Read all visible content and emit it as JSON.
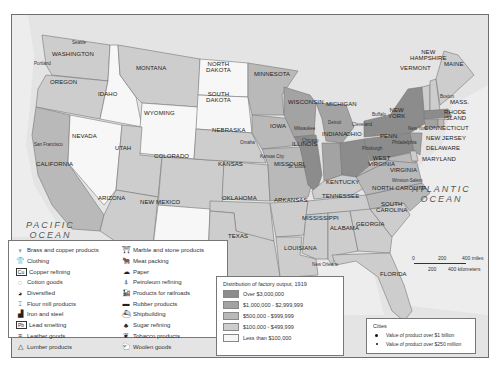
{
  "map": {
    "title": "Distribution of factory output, 1919",
    "oceans": [
      {
        "name": "PACIFIC\nOCEAN"
      },
      {
        "name": "ATLANTIC\nOCEAN"
      },
      {
        "name": "Gulf of Mexico"
      }
    ],
    "states": [
      {
        "name": "Washington",
        "tier": "$100,000 - $499,999",
        "industry": "Lumber products"
      },
      {
        "name": "Oregon",
        "tier": "$100,000 - $499,999",
        "industry": "Lumber products"
      },
      {
        "name": "California",
        "tier": "$500,000 - $999,999",
        "industry": "Diversified"
      },
      {
        "name": "Idaho",
        "tier": "Less than $100,000",
        "industry": "Lumber products"
      },
      {
        "name": "Nevada",
        "tier": "Less than $100,000",
        "industry": "Products for railroads"
      },
      {
        "name": "Montana",
        "tier": "$100,000 - $499,999",
        "industry": "Flour mill products"
      },
      {
        "name": "Wyoming",
        "tier": "Less than $100,000",
        "industry": "Products for railroads"
      },
      {
        "name": "Utah",
        "tier": "$100,000 - $499,999",
        "industry": "Lead smelting"
      },
      {
        "name": "Arizona",
        "tier": "$100,000 - $499,999",
        "industry": "Copper refining"
      },
      {
        "name": "Colorado",
        "tier": "$100,000 - $499,999",
        "industry": "Meat packing"
      },
      {
        "name": "New Mexico",
        "tier": "Less than $100,000",
        "industry": "Products for railroads"
      },
      {
        "name": "North Dakota",
        "tier": "Less than $100,000",
        "industry": "Flour mill products"
      },
      {
        "name": "South Dakota",
        "tier": "Less than $100,000",
        "industry": "Flour mill products"
      },
      {
        "name": "Nebraska",
        "tier": "$100,000 - $499,999",
        "industry": "Meat packing"
      },
      {
        "name": "Kansas",
        "tier": "$100,000 - $499,999",
        "industry": "Meat packing"
      },
      {
        "name": "Oklahoma",
        "tier": "$100,000 - $499,999",
        "industry": "Petroleum refining"
      },
      {
        "name": "Texas",
        "tier": "$100,000 - $499,999",
        "industry": "Petroleum refining"
      },
      {
        "name": "Minnesota",
        "tier": "$500,000 - $999,999",
        "industry": "Flour mill products"
      },
      {
        "name": "Iowa",
        "tier": "$500,000 - $999,999",
        "industry": "Meat packing"
      },
      {
        "name": "Missouri",
        "tier": "$500,000 - $999,999",
        "industry": "Meat packing"
      },
      {
        "name": "Arkansas",
        "tier": "$100,000 - $499,999",
        "industry": "Lumber products"
      },
      {
        "name": "Louisiana",
        "tier": "$100,000 - $499,999",
        "industry": "Sugar refining"
      },
      {
        "name": "Wisconsin",
        "tier": "$1,000,000 - $2,999,999",
        "industry": "Diversified"
      },
      {
        "name": "Illinois",
        "tier": "Over $3,000,000",
        "industry": "Meat packing"
      },
      {
        "name": "Michigan",
        "tier": "$1,000,000 - $2,999,999",
        "industry": "Diversified"
      },
      {
        "name": "Indiana",
        "tier": "$1,000,000 - $2,999,999",
        "industry": "Iron and steel"
      },
      {
        "name": "Ohio",
        "tier": "Over $3,000,000",
        "industry": "Iron and steel"
      },
      {
        "name": "Kentucky",
        "tier": "$100,000 - $499,999",
        "industry": "Flour mill products"
      },
      {
        "name": "Tennessee",
        "tier": "$100,000 - $499,999",
        "industry": "Flour mill products"
      },
      {
        "name": "Mississippi",
        "tier": "$100,000 - $499,999",
        "industry": "Lumber products"
      },
      {
        "name": "Alabama",
        "tier": "$100,000 - $499,999",
        "industry": "Cotton goods"
      },
      {
        "name": "Georgia",
        "tier": "$100,000 - $499,999",
        "industry": "Cotton goods"
      },
      {
        "name": "Florida",
        "tier": "$100,000 - $499,999",
        "industry": "Lumber products"
      },
      {
        "name": "South Carolina",
        "tier": "$100,000 - $499,999",
        "industry": "Cotton goods"
      },
      {
        "name": "North Carolina",
        "tier": "$500,000 - $999,999",
        "industry": "Cotton goods"
      },
      {
        "name": "Virginia",
        "tier": "$500,000 - $999,999",
        "industry": "Cotton goods"
      },
      {
        "name": "West Virginia",
        "tier": "$500,000 - $999,999",
        "industry": "Iron and steel"
      },
      {
        "name": "Pennsylvania",
        "tier": "Over $3,000,000",
        "industry": "Iron and steel"
      },
      {
        "name": "New York",
        "tier": "Over $3,000,000",
        "industry": "Clothing"
      },
      {
        "name": "New Jersey",
        "tier": "$1,000,000 - $2,999,999",
        "industry": "Diversified"
      },
      {
        "name": "Delaware",
        "tier": "$100,000 - $499,999",
        "industry": "Leather goods"
      },
      {
        "name": "Maryland",
        "tier": "$500,000 - $999,999",
        "industry": "Shipbuilding, Clothing"
      },
      {
        "name": "Connecticut",
        "tier": "$1,000,000 - $2,999,999",
        "industry": "Brass and copper products"
      },
      {
        "name": "Rhode Island",
        "tier": "$500,000 - $999,999",
        "industry": "Cotton goods, Woolen goods"
      },
      {
        "name": "Massachusetts",
        "tier": "Over $3,000,000",
        "industry": "Cotton goods"
      },
      {
        "name": "Vermont",
        "tier": "$100,000 - $499,999",
        "industry": "Marble and stone products"
      },
      {
        "name": "New Hampshire",
        "tier": "$100,000 - $499,999",
        "industry": "Cotton goods"
      },
      {
        "name": "Maine",
        "tier": "$100,000 - $499,999",
        "industry": "Paper"
      }
    ],
    "cities": [
      "Seattle",
      "Portland",
      "San Francisco",
      "Omaha",
      "Kansas City",
      "St. Louis",
      "Minneapolis",
      "Milwaukee",
      "Chicago",
      "Detroit",
      "Cleveland",
      "Cincinnati",
      "Toledo",
      "Buffalo",
      "Rochester",
      "Pittsburgh",
      "Philadelphia",
      "New York",
      "Boston",
      "Baltimore",
      "Louisville",
      "New Orleans",
      "Winston-Salem"
    ]
  },
  "state_labels": {
    "wa": "WASHINGTON",
    "or": "OREGON",
    "ca": "CALIFORNIA",
    "id": "IDAHO",
    "nv": "NEVADA",
    "mt": "MONTANA",
    "wy": "WYOMING",
    "ut": "UTAH",
    "az": "ARIZONA",
    "co": "COLORADO",
    "nm": "NEW MEXICO",
    "nd": "NORTH\nDAKOTA",
    "sd": "SOUTH\nDAKOTA",
    "ne": "NEBRASKA",
    "ks": "KANSAS",
    "ok": "OKLAHOMA",
    "tx": "TEXAS",
    "mn": "MINNESOTA",
    "ia": "IOWA",
    "mo": "MISSOURI",
    "ar": "ARKANSAS",
    "la": "LOUISIANA",
    "wi": "WISCONSIN",
    "il": "ILLINOIS",
    "mi": "MICHIGAN",
    "in": "INDIANA",
    "oh": "OHIO",
    "ky": "KENTUCKY",
    "tn": "TENNESSEE",
    "ms": "MISSISSIPPI",
    "al": "ALABAMA",
    "ga": "GEORGIA",
    "fl": "FLORIDA",
    "sc": "SOUTH\nCAROLINA",
    "nc": "NORTH CAROLINA",
    "va": "VIRGINIA",
    "wv": "WEST\nVIRGINIA",
    "pa": "PENN.",
    "ny": "NEW\nYORK",
    "nj": "NEW JERSEY",
    "de": "DELAWARE",
    "md": "MARYLAND",
    "ct": "CONNECTICUT",
    "ri": "RHODE\nISLAND",
    "ma": "MASS.",
    "vt": "VERMONT",
    "nh": "NEW\nHAMPSHIRE",
    "me": "MAINE"
  },
  "city_labels": {
    "seattle": "Seattle",
    "portland": "Portland",
    "sf": "San Francisco",
    "omaha": "Omaha",
    "kc": "Kansas City",
    "stl": "St. Louis",
    "minneapolis": "Minneapolis",
    "milwaukee": "Milwaukee",
    "chicago": "Chicago",
    "detroit": "Detroit",
    "cleveland": "Cleveland",
    "buffalo": "Buffalo",
    "pittsburgh": "Pittsburgh",
    "philadelphia": "Philadelphia",
    "nyc": "New York",
    "boston": "Boston",
    "neworleans": "New Orleans",
    "winston": "Winston-Salem",
    "gulf": "Gulf of Mexico"
  },
  "oceans": {
    "pacific": "PACIFIC\nOCEAN",
    "atlantic": "ATLANTIC\nOCEAN"
  },
  "industry_legend": {
    "col1": [
      {
        "icon": "brass-icon",
        "glyph": "♆",
        "label": "Brass and copper products"
      },
      {
        "icon": "clothing-icon",
        "glyph": "👕",
        "label": "Clothing"
      },
      {
        "icon": "copper-icon",
        "glyph": "Cu",
        "label": "Copper refining"
      },
      {
        "icon": "cotton-icon",
        "glyph": "◌",
        "label": "Cotton goods"
      },
      {
        "icon": "diversified-icon",
        "glyph": "◕",
        "label": "Diversified"
      },
      {
        "icon": "flour-icon",
        "glyph": "⌶",
        "label": "Flour mill products"
      },
      {
        "icon": "iron-steel-icon",
        "glyph": "▟",
        "label": "Iron and steel"
      },
      {
        "icon": "lead-icon",
        "glyph": "Pb",
        "label": "Lead smelting"
      },
      {
        "icon": "leather-icon",
        "glyph": "≡",
        "label": "Leather goods"
      },
      {
        "icon": "lumber-icon",
        "glyph": "△",
        "label": "Lumber products"
      }
    ],
    "col2": [
      {
        "icon": "marble-icon",
        "glyph": "⛩",
        "label": "Marble and stone products"
      },
      {
        "icon": "meat-icon",
        "glyph": "🐂",
        "label": "Meat packing"
      },
      {
        "icon": "paper-icon",
        "glyph": "☁",
        "label": "Paper"
      },
      {
        "icon": "petroleum-icon",
        "glyph": "⍋",
        "label": "Petroleum refining"
      },
      {
        "icon": "railroad-icon",
        "glyph": "🚂",
        "label": "Products for railroads"
      },
      {
        "icon": "rubber-icon",
        "glyph": "▬",
        "label": "Rubber products"
      },
      {
        "icon": "ship-icon",
        "glyph": "⛴",
        "label": "Shipbuilding"
      },
      {
        "icon": "sugar-icon",
        "glyph": "♣",
        "label": "Sugar refining"
      },
      {
        "icon": "tobacco-icon",
        "glyph": "❦",
        "label": "Tobacco products"
      },
      {
        "icon": "wool-icon",
        "glyph": "🐑",
        "label": "Woolen goods"
      }
    ]
  },
  "distribution_legend": {
    "title": "Distribution of factory output, 1919",
    "tiers": [
      {
        "label": "Over $3,000,000",
        "color": "#8c8c8c"
      },
      {
        "label": "$1,000,000 - $2,999,999",
        "color": "#a3a3a3"
      },
      {
        "label": "$500,000 - $999,999",
        "color": "#b9b9b9"
      },
      {
        "label": "$100,000 - $499,999",
        "color": "#cdcdcd"
      },
      {
        "label": "Less than $100,000",
        "color": "#f7f7f7"
      }
    ]
  },
  "cities_legend": {
    "title": "Cities",
    "items": [
      {
        "label": "Value of product over $1 billion"
      },
      {
        "label": "Value of product over $250 million"
      }
    ]
  },
  "scale": {
    "ticks": [
      "0",
      "200",
      "400 miles"
    ],
    "ticks_km": [
      "0",
      "200",
      "400 kilometers"
    ]
  }
}
